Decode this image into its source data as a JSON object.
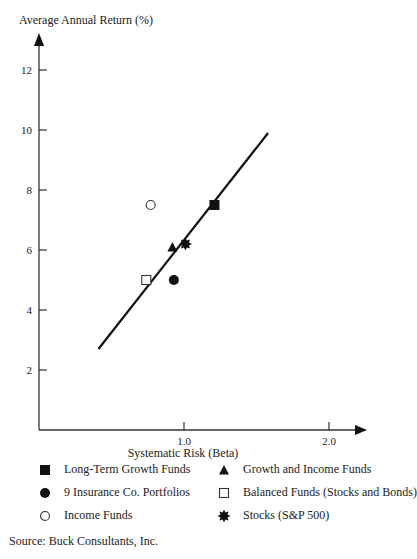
{
  "chart_data": {
    "type": "scatter",
    "title": "",
    "xlabel": "Systematic Risk (Beta)",
    "ylabel": "Average Annual Return (%)",
    "xlim": [
      0,
      2.2
    ],
    "ylim": [
      0,
      13.5
    ],
    "x_ticks": [
      1.0,
      2.0
    ],
    "x_tick_labels": [
      "1.0",
      "2.0"
    ],
    "y_ticks": [
      2,
      4,
      6,
      8,
      10,
      12
    ],
    "y_tick_labels": [
      "2",
      "4",
      "6",
      "8",
      "10",
      "12"
    ],
    "grid": false,
    "series": [
      {
        "name": "Long-Term Growth Funds",
        "marker": "filled-square",
        "points": [
          {
            "x": 1.21,
            "y": 7.5
          }
        ]
      },
      {
        "name": "Growth and Income Funds",
        "marker": "filled-triangle",
        "points": [
          {
            "x": 0.92,
            "y": 6.1
          }
        ]
      },
      {
        "name": "9 Insurance Co. Portfolios",
        "marker": "filled-circle",
        "points": [
          {
            "x": 0.93,
            "y": 5.0
          }
        ]
      },
      {
        "name": "Balanced Funds (Stocks and Bonds)",
        "marker": "open-square",
        "points": [
          {
            "x": 0.74,
            "y": 5.0
          }
        ]
      },
      {
        "name": "Income Funds",
        "marker": "open-circle",
        "points": [
          {
            "x": 0.77,
            "y": 7.5
          }
        ]
      },
      {
        "name": "Stocks (S&P 500)",
        "marker": "star",
        "points": [
          {
            "x": 1.01,
            "y": 6.2
          }
        ]
      }
    ],
    "trend_line": {
      "name": "Market line",
      "from": {
        "x": 0.41,
        "y": 2.7
      },
      "to": {
        "x": 1.58,
        "y": 9.9
      }
    },
    "legend_placement": "bottom"
  },
  "legend": [
    {
      "label": "Long-Term Growth Funds",
      "marker": "filled-square"
    },
    {
      "label": "Growth and Income Funds",
      "marker": "filled-triangle"
    },
    {
      "label": "9 Insurance Co. Portfolios",
      "marker": "filled-circle"
    },
    {
      "label": "Balanced Funds (Stocks and Bonds)",
      "marker": "open-square"
    },
    {
      "label": "Income Funds",
      "marker": "open-circle"
    },
    {
      "label": "Stocks (S&P 500)",
      "marker": "star"
    }
  ],
  "source": "Source: Buck Consultants, Inc."
}
